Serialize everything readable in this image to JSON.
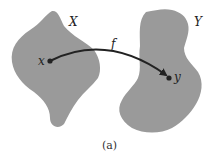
{
  "diagram": {
    "caption": "(a)",
    "sets": [
      {
        "name": "X",
        "label": "X",
        "fill": "#9a9a9a"
      },
      {
        "name": "Y",
        "label": "Y",
        "fill": "#9a9a9a"
      }
    ],
    "points": [
      {
        "label": "x",
        "set": "X"
      },
      {
        "label": "y",
        "set": "Y"
      }
    ],
    "mapping": {
      "label": "f",
      "from": "x",
      "to": "y"
    }
  }
}
